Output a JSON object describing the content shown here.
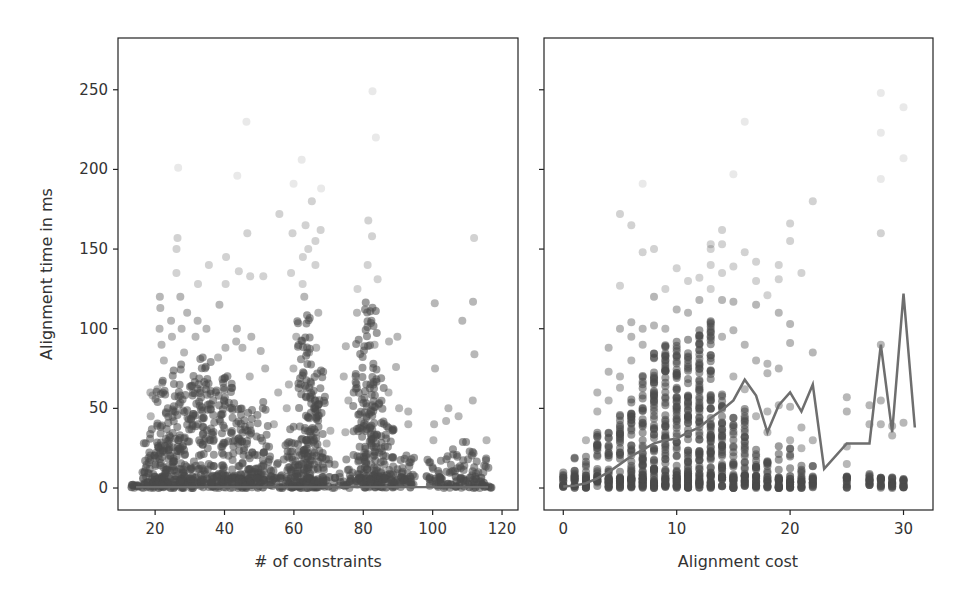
{
  "chart_data": [
    {
      "type": "scatter",
      "title": "",
      "xlabel": "# of constraints",
      "ylabel": "Alignment time in ms",
      "xlim": [
        9.3,
        124.6
      ],
      "ylim": [
        -13.8,
        282.5
      ],
      "xticks": [
        20,
        40,
        60,
        80,
        100,
        120
      ],
      "yticks": [
        0,
        50,
        100,
        150,
        200,
        250
      ],
      "grid": false,
      "marker_color": "#4a4a4a",
      "marker_alpha": 0.4,
      "columns": [
        {
          "x": 15,
          "dense_max": 3,
          "outliers": []
        },
        {
          "x": 18,
          "dense_max": 30,
          "outliers": [
            45,
            60
          ]
        },
        {
          "x": 20,
          "dense_max": 43,
          "outliers": [
            58,
            62
          ]
        },
        {
          "x": 22,
          "dense_max": 70,
          "outliers": [
            80,
            90,
            100,
            113,
            120
          ]
        },
        {
          "x": 24,
          "dense_max": 50,
          "outliers": [
            95,
            105
          ]
        },
        {
          "x": 27,
          "dense_max": 80,
          "outliers": [
            100,
            120,
            135,
            150,
            157,
            201
          ]
        },
        {
          "x": 29,
          "dense_max": 65,
          "outliers": [
            85,
            110
          ]
        },
        {
          "x": 32,
          "dense_max": 72,
          "outliers": [
            95,
            105,
            128
          ]
        },
        {
          "x": 35,
          "dense_max": 85,
          "outliers": [
            100,
            140
          ]
        },
        {
          "x": 38,
          "dense_max": 62,
          "outliers": [
            82,
            115
          ]
        },
        {
          "x": 41,
          "dense_max": 72,
          "outliers": [
            88,
            128,
            145
          ]
        },
        {
          "x": 44,
          "dense_max": 55,
          "outliers": [
            92,
            100,
            136,
            196
          ]
        },
        {
          "x": 46,
          "dense_max": 52,
          "outliers": [
            88,
            160,
            230
          ]
        },
        {
          "x": 48,
          "dense_max": 40,
          "outliers": [
            70,
            95,
            133
          ]
        },
        {
          "x": 51,
          "dense_max": 55,
          "outliers": [
            75,
            86,
            133
          ]
        },
        {
          "x": 55,
          "dense_max": 20,
          "outliers": [
            40,
            60,
            172
          ]
        },
        {
          "x": 58,
          "dense_max": 28,
          "outliers": [
            50,
            65
          ]
        },
        {
          "x": 60,
          "dense_max": 40,
          "outliers": [
            75,
            95,
            135,
            160,
            191
          ]
        },
        {
          "x": 63,
          "dense_max": 115,
          "outliers": [
            120,
            128,
            145,
            165,
            206
          ]
        },
        {
          "x": 65,
          "dense_max": 72,
          "outliers": [
            85,
            150,
            180
          ]
        },
        {
          "x": 67,
          "dense_max": 75,
          "outliers": [
            88,
            110,
            140,
            155,
            162,
            188
          ]
        },
        {
          "x": 70,
          "dense_max": 20,
          "outliers": [
            28,
            36
          ]
        },
        {
          "x": 75,
          "dense_max": 18,
          "outliers": [
            35,
            55,
            70,
            89
          ]
        },
        {
          "x": 79,
          "dense_max": 95,
          "outliers": [
            110,
            125
          ]
        },
        {
          "x": 82,
          "dense_max": 120,
          "outliers": [
            140,
            158,
            168,
            249
          ]
        },
        {
          "x": 84,
          "dense_max": 70,
          "outliers": [
            90,
            131,
            220
          ]
        },
        {
          "x": 87,
          "dense_max": 45,
          "outliers": [
            60,
            92
          ]
        },
        {
          "x": 90,
          "dense_max": 30,
          "outliers": [
            50,
            76,
            95
          ]
        },
        {
          "x": 93,
          "dense_max": 25,
          "outliers": [
            40,
            48
          ]
        },
        {
          "x": 100,
          "dense_max": 20,
          "outliers": [
            30,
            40,
            75,
            116
          ]
        },
        {
          "x": 104,
          "dense_max": 25,
          "outliers": [
            42,
            50
          ]
        },
        {
          "x": 108,
          "dense_max": 30,
          "outliers": [
            45,
            105
          ]
        },
        {
          "x": 112,
          "dense_max": 25,
          "outliers": [
            55,
            84,
            117,
            157
          ]
        },
        {
          "x": 115,
          "dense_max": 20,
          "outliers": [
            30
          ]
        }
      ],
      "trend_line": {
        "description": "mean line near zero across x",
        "y": 0.5
      }
    },
    {
      "type": "scatter",
      "title": "",
      "xlabel": "Alignment cost",
      "ylabel": "",
      "xlim": [
        -1.7,
        32.6
      ],
      "ylim": [
        -13.8,
        282.5
      ],
      "xticks": [
        0,
        10,
        20,
        30
      ],
      "yticks": [
        0,
        50,
        100,
        150,
        200,
        250
      ],
      "shared_y": true,
      "grid": false,
      "marker_color": "#4a4a4a",
      "marker_alpha": 0.4,
      "columns": [
        {
          "x": 0,
          "dense_max": 10,
          "outliers": []
        },
        {
          "x": 1,
          "dense_max": 20,
          "outliers": []
        },
        {
          "x": 2,
          "dense_max": 24,
          "outliers": [
            30
          ]
        },
        {
          "x": 3,
          "dense_max": 35,
          "outliers": [
            48,
            60
          ]
        },
        {
          "x": 4,
          "dense_max": 40,
          "outliers": [
            55,
            73,
            88
          ]
        },
        {
          "x": 5,
          "dense_max": 50,
          "outliers": [
            63,
            70,
            100,
            127,
            172
          ]
        },
        {
          "x": 6,
          "dense_max": 58,
          "outliers": [
            80,
            95,
            104,
            165
          ]
        },
        {
          "x": 7,
          "dense_max": 72,
          "outliers": [
            90,
            100,
            148,
            191
          ]
        },
        {
          "x": 8,
          "dense_max": 85,
          "outliers": [
            102,
            120,
            150
          ]
        },
        {
          "x": 9,
          "dense_max": 90,
          "outliers": [
            100,
            125
          ]
        },
        {
          "x": 10,
          "dense_max": 92,
          "outliers": [
            112,
            138
          ]
        },
        {
          "x": 11,
          "dense_max": 95,
          "outliers": [
            110,
            130
          ]
        },
        {
          "x": 12,
          "dense_max": 100,
          "outliers": [
            118,
            132
          ]
        },
        {
          "x": 13,
          "dense_max": 105,
          "outliers": [
            125,
            140,
            150,
            153
          ]
        },
        {
          "x": 14,
          "dense_max": 60,
          "outliers": [
            95,
            118,
            135,
            153,
            162
          ]
        },
        {
          "x": 15,
          "dense_max": 45,
          "outliers": [
            70,
            99,
            117,
            139,
            197
          ]
        },
        {
          "x": 16,
          "dense_max": 50,
          "outliers": [
            62,
            90,
            148,
            230
          ]
        },
        {
          "x": 17,
          "dense_max": 30,
          "outliers": [
            45,
            80,
            115,
            130,
            142
          ]
        },
        {
          "x": 18,
          "dense_max": 20,
          "outliers": [
            35,
            48,
            72,
            78,
            121
          ]
        },
        {
          "x": 19,
          "dense_max": 28,
          "outliers": [
            52,
            75,
            110,
            131,
            140
          ]
        },
        {
          "x": 20,
          "dense_max": 25,
          "outliers": [
            30,
            51,
            91,
            103,
            155,
            166
          ]
        },
        {
          "x": 21,
          "dense_max": 15,
          "outliers": [
            25,
            38,
            135
          ]
        },
        {
          "x": 22,
          "dense_max": 15,
          "outliers": [
            30,
            85,
            180
          ]
        },
        {
          "x": 25,
          "dense_max": 8,
          "outliers": [
            15,
            26,
            48,
            57
          ]
        },
        {
          "x": 27,
          "dense_max": 10,
          "outliers": [
            40,
            52
          ]
        },
        {
          "x": 28,
          "dense_max": 8,
          "outliers": [
            40,
            55,
            90,
            160,
            194,
            223,
            248
          ]
        },
        {
          "x": 29,
          "dense_max": 8,
          "outliers": [
            33,
            39
          ]
        },
        {
          "x": 30,
          "dense_max": 6,
          "outliers": [
            41,
            207,
            239
          ]
        }
      ],
      "trend_line": {
        "color": "#6e6e6e",
        "x": [
          0,
          1,
          2,
          3,
          4,
          5,
          6,
          7,
          8,
          9,
          10,
          11,
          12,
          13,
          14,
          15,
          16,
          17,
          18,
          19,
          20,
          21,
          22,
          23,
          25,
          27,
          28,
          29,
          30,
          31
        ],
        "y": [
          1,
          1.5,
          3,
          6,
          10,
          15,
          20,
          24,
          28,
          30,
          31,
          35,
          38,
          44,
          49,
          55,
          68,
          58,
          35,
          52,
          60,
          48,
          65,
          12,
          28,
          28,
          90,
          35,
          122,
          38
        ]
      }
    }
  ]
}
